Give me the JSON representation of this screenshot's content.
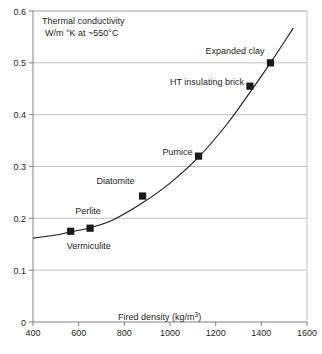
{
  "chart_data": {
    "type": "scatter",
    "title": "",
    "annotations": [
      "Thermal conductivity",
      "W/m °K at ~550°C"
    ],
    "title_line1": "Thermal conductivity",
    "title_line2": "W/m °K at ~550°C",
    "xlabel_main": "Fired density (kg/m",
    "xlabel_sup": "3",
    "xlabel_close": ")",
    "xlabel": "Fired density (kg/m3)",
    "ylabel": "Thermal conductivity W/m °K at ~550°C",
    "xlim": [
      400,
      1600
    ],
    "ylim": [
      0,
      0.6
    ],
    "grid": true,
    "legend": "none",
    "xticks": [
      "400",
      "600",
      "800",
      "1000",
      "1200",
      "1400",
      "1600"
    ],
    "xtick_values": [
      400,
      600,
      800,
      1000,
      1200,
      1400,
      1600
    ],
    "yticks": [
      "0",
      "0.1",
      "0.2",
      "0.3",
      "0.4",
      "0.5",
      "0.6"
    ],
    "ytick_values": [
      0,
      0.1,
      0.2,
      0.3,
      0.4,
      0.5,
      0.6
    ],
    "marker_style": "filled-square",
    "marker_color": "#1a1a1a",
    "line_color": "#1a1a1a",
    "grid_color": "#b3b3b3",
    "axis_color": "#808080",
    "points": [
      {
        "label": "Vermiculite",
        "x": 565,
        "y": 0.175,
        "label_dx": -4,
        "label_dy": 18,
        "anchor": "start"
      },
      {
        "label": "Perlite",
        "x": 650,
        "y": 0.181,
        "label_dx": -2,
        "label_dy": -14,
        "anchor": "middle"
      },
      {
        "label": "Diatomite",
        "x": 880,
        "y": 0.243,
        "label_dx": -8,
        "label_dy": -12,
        "anchor": "end"
      },
      {
        "label": "Pumice",
        "x": 1125,
        "y": 0.32,
        "label_dx": -6,
        "label_dy": -1,
        "anchor": "end"
      },
      {
        "label": "HT insulating brick",
        "x": 1350,
        "y": 0.455,
        "label_dx": -6,
        "label_dy": -1,
        "anchor": "end"
      },
      {
        "label": "Expanded clay",
        "x": 1440,
        "y": 0.5,
        "label_dx": -6,
        "label_dy": -9,
        "anchor": "end"
      }
    ],
    "curve": [
      {
        "x": 400,
        "y": 0.162
      },
      {
        "x": 500,
        "y": 0.168
      },
      {
        "x": 565,
        "y": 0.174
      },
      {
        "x": 650,
        "y": 0.182
      },
      {
        "x": 750,
        "y": 0.197
      },
      {
        "x": 880,
        "y": 0.23
      },
      {
        "x": 1000,
        "y": 0.268
      },
      {
        "x": 1125,
        "y": 0.318
      },
      {
        "x": 1250,
        "y": 0.382
      },
      {
        "x": 1350,
        "y": 0.443
      },
      {
        "x": 1440,
        "y": 0.5
      },
      {
        "x": 1540,
        "y": 0.567
      }
    ]
  }
}
